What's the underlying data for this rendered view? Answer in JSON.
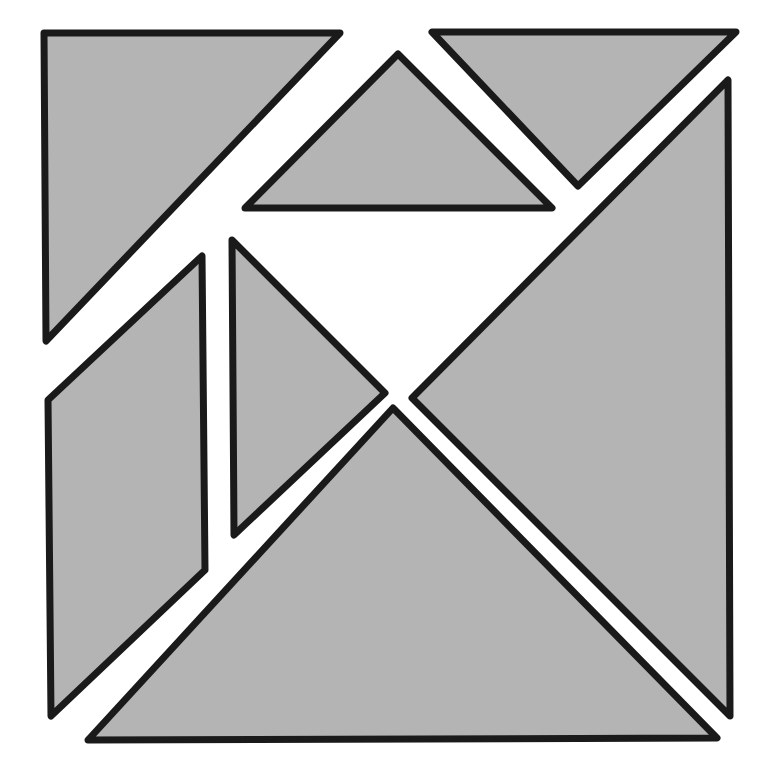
{
  "diagram": {
    "title": "Tangram square dissection",
    "type": "geometric-dissection",
    "canvas": {
      "width": 768,
      "height": 783
    },
    "background_color": "#ffffff",
    "fill_color": "#b4b4b4",
    "stroke_color": "#1a1a1a",
    "stroke_width": 7,
    "piece_count": 7,
    "outer_square": {
      "label": "Outer square bounds",
      "corners": [
        [
          44,
          33
        ],
        [
          738,
          32
        ],
        [
          730,
          740
        ],
        [
          48,
          742
        ]
      ]
    },
    "pieces": [
      {
        "id": "large-triangle-upper-left",
        "label": "Large right triangle (upper left)",
        "kind": "large-triangle",
        "points": "44,33 340,33 46,341"
      },
      {
        "id": "small-triangle-top",
        "label": "Small right triangle (top middle)",
        "kind": "medium-triangle",
        "points": "398,54 552,208 245,208"
      },
      {
        "id": "small-triangle-top-right",
        "label": "Small right triangle (top right)",
        "kind": "small-triangle",
        "points": "432,32 736,32 578,186"
      },
      {
        "id": "parallelogram-left",
        "label": "Parallelogram (left)",
        "kind": "parallelogram",
        "points": "48,400 202,256 205,570 51,716"
      },
      {
        "id": "medium-triangle-middle",
        "label": "Medium right triangle (middle)",
        "kind": "small-triangle",
        "points": "232,240 385,393 234,535"
      },
      {
        "id": "large-triangle-right",
        "label": "Large right triangle (right)",
        "kind": "large-triangle",
        "points": "728,80 730,716 412,398"
      },
      {
        "id": "large-triangle-bottom",
        "label": "Large right triangle (bottom)",
        "kind": "large-triangle",
        "points": "393,408 717,738 88,740"
      }
    ]
  }
}
